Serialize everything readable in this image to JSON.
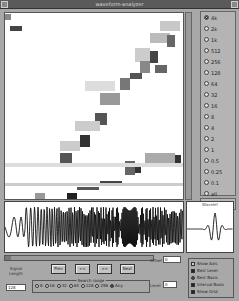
{
  "window": {
    "title": "waveform-analyzer"
  },
  "frequency_options": [
    {
      "label": "4k",
      "selected": true
    },
    {
      "label": "2k",
      "selected": false
    },
    {
      "label": "1k",
      "selected": false
    },
    {
      "label": "512",
      "selected": false
    },
    {
      "label": "256",
      "selected": false
    },
    {
      "label": "128",
      "selected": false
    },
    {
      "label": "64",
      "selected": false
    },
    {
      "label": "32",
      "selected": false
    },
    {
      "label": "16",
      "selected": false
    },
    {
      "label": "8",
      "selected": false
    },
    {
      "label": "4",
      "selected": false
    },
    {
      "label": "2",
      "selected": false
    },
    {
      "label": "1",
      "selected": false
    },
    {
      "label": "0.5",
      "selected": false
    },
    {
      "label": "0.25",
      "selected": false
    },
    {
      "label": "0.1",
      "selected": false
    },
    {
      "label": "all",
      "selected": false
    }
  ],
  "mini_plot": {
    "label": "Wavelet"
  },
  "controls": {
    "signal_length_label": "Signal Length",
    "signal_length_value": "128",
    "buttons": {
      "prev": "Prev",
      "back": "<<",
      "fwd": ">>",
      "next": "Next"
    },
    "search_group_label": "Search range",
    "search_range": [
      {
        "label": "8",
        "selected": false
      },
      {
        "label": "16",
        "selected": false
      },
      {
        "label": "32",
        "selected": false
      },
      {
        "label": "64",
        "selected": false
      },
      {
        "label": "128",
        "selected": false
      },
      {
        "label": "256",
        "selected": false
      },
      {
        "label": "Any",
        "selected": true
      }
    ],
    "offset_label": "Offset",
    "offset_value": "0",
    "level_label": "Level",
    "level_value": "0"
  },
  "display_options": [
    {
      "label": "Show Axis",
      "type": "check",
      "checked": false
    },
    {
      "label": "Best Level",
      "type": "check",
      "checked": true
    },
    {
      "label": "Best Basis",
      "type": "radio",
      "checked": true
    },
    {
      "label": "Interval Basis",
      "type": "check",
      "checked": true
    },
    {
      "label": "Show Grid",
      "type": "check",
      "checked": true
    }
  ]
}
